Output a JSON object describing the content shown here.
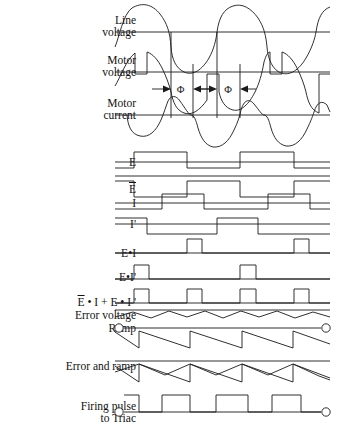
{
  "figure": {
    "width": 343,
    "height": 440,
    "stroke_color": "#1a1a1a",
    "background": "#ffffff"
  },
  "annotations": {
    "phi_symbol": "Φ",
    "phi_left_label": "Φ",
    "phi_right_label": "Φ"
  },
  "rows": [
    {
      "id": "line-voltage",
      "label_lines": [
        "Line",
        "voltage"
      ],
      "baseline_y": 32,
      "kind": "sine"
    },
    {
      "id": "motor-voltage",
      "label_lines": [
        "Motor",
        "voltage"
      ],
      "baseline_y": 72,
      "kind": "chopped-sine"
    },
    {
      "id": "motor-current",
      "label_lines": [
        "Motor",
        "current"
      ],
      "baseline_y": 115,
      "kind": "lagging-sine"
    },
    {
      "id": "signal-e",
      "label_lines": [
        "E"
      ],
      "baseline_y": 162,
      "kind": "square"
    },
    {
      "id": "signal-e-bar",
      "label_lines": [
        "E"
      ],
      "overline": [
        0
      ],
      "baseline_y": 190,
      "kind": "square-inverted"
    },
    {
      "id": "signal-i",
      "label_lines": [
        "I"
      ],
      "baseline_y": 207,
      "kind": "square-lagging"
    },
    {
      "id": "signal-i-prime",
      "label_lines": [
        "I'"
      ],
      "baseline_y": 228,
      "kind": "square-lagging-inverted"
    },
    {
      "id": "signal-e-and-i",
      "label_lines": [
        "E•I"
      ],
      "baseline_y": 253,
      "kind": "pulses"
    },
    {
      "id": "signal-e-and-ip",
      "label_lines": [
        "E•I'"
      ],
      "baseline_y": 279,
      "kind": "pulses"
    },
    {
      "id": "signal-sum",
      "label_lines": [
        "E • I + E • I '"
      ],
      "overline": [
        0
      ],
      "baseline_y": 303,
      "kind": "pulses"
    },
    {
      "id": "error-voltage",
      "label_lines": [
        "Error voltage"
      ],
      "baseline_y": 318,
      "kind": "ripple"
    },
    {
      "id": "ramp",
      "label_lines": [
        "Ramp"
      ],
      "baseline_y": 328,
      "kind": "sawtooth"
    },
    {
      "id": "error-and-ramp",
      "label_lines": [
        "Error and ramp"
      ],
      "baseline_y": 366,
      "kind": "sawtooth-overlay"
    },
    {
      "id": "firing-pulse",
      "label_lines": [
        "Firing pulse",
        "to Triac"
      ],
      "baseline_y": 412,
      "kind": "firing-pulses"
    }
  ],
  "chart_data": {
    "type": "line",
    "xlabel": "",
    "ylabel": "",
    "x_domain": [
      115,
      330
    ],
    "grid": false,
    "legend": "none",
    "note": "Thirteen stacked time-aligned waveform traces sharing one horizontal time axis; two phase-angle markers labelled Phi mark the conduction delay.",
    "traces": [
      {
        "name": "Line voltage",
        "shape": "sine",
        "periods": 2,
        "amplitude": 28,
        "phase_deg": 0,
        "baseline_y": 32
      },
      {
        "name": "Motor voltage",
        "shape": "phase-chopped sine with notches",
        "periods": 2,
        "amplitude": 26,
        "baseline_y": 72
      },
      {
        "name": "Motor current",
        "shape": "lagging sine half cycles",
        "periods": 2,
        "amplitude": 26,
        "phase_deg": -35,
        "baseline_y": 115
      },
      {
        "name": "E",
        "shape": "square",
        "duty": 0.5,
        "periods": 2,
        "high": 1,
        "low": 0,
        "baseline_y": 162
      },
      {
        "name": "E-bar",
        "shape": "square inverted",
        "duty": 0.5,
        "periods": 2,
        "high": 1,
        "low": 0,
        "baseline_y": 190
      },
      {
        "name": "I",
        "shape": "square lagging",
        "duty": 0.5,
        "periods": 2,
        "lag_fraction": 0.18,
        "baseline_y": 207
      },
      {
        "name": "I-prime",
        "shape": "square lagging inverted",
        "duty": 0.5,
        "periods": 2,
        "lag_fraction": 0.18,
        "baseline_y": 228
      },
      {
        "name": "E and I",
        "shape": "narrow pulses",
        "pulse_count": 2,
        "baseline_y": 253
      },
      {
        "name": "E and I-prime",
        "shape": "narrow pulses",
        "pulse_count": 2,
        "baseline_y": 279
      },
      {
        "name": "E-bar and I plus E and I-prime",
        "shape": "narrow pulses",
        "pulse_count": 4,
        "baseline_y": 303
      },
      {
        "name": "Error voltage",
        "shape": "small triangular ripple",
        "cycles": 6,
        "amplitude": 5,
        "baseline_y": 318
      },
      {
        "name": "Ramp",
        "shape": "descending sawtooth",
        "cycles": 4,
        "baseline_y": 328
      },
      {
        "name": "Error and ramp",
        "shape": "descending sawtooth overlaid with ripple",
        "cycles": 4,
        "baseline_y": 366
      },
      {
        "name": "Firing pulse to Triac",
        "shape": "rectangular pulses of increasing width",
        "pulse_count": 4,
        "baseline_y": 412
      }
    ]
  }
}
